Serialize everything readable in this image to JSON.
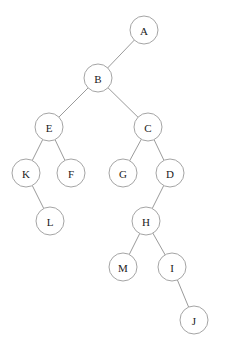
{
  "diagram": {
    "kind": "tree-diagram",
    "canvas": {
      "width": 225,
      "height": 356,
      "background": "#ffffff"
    },
    "style": {
      "node_radius": 14,
      "node_fill": "#ffffff",
      "node_stroke": "#9a9a9a",
      "edge_stroke": "#8f8f8f",
      "label_color": "#1b1b1b",
      "stroke_width": 0.9,
      "label_font_size": 11
    },
    "root": "A"
  },
  "chart_data": {
    "type": "diagram",
    "title": "",
    "nodes": [
      {
        "id": "A",
        "label": "A",
        "x": 144,
        "y": 30,
        "r": 14,
        "depth": 0
      },
      {
        "id": "B",
        "label": "B",
        "x": 98,
        "y": 78,
        "r": 14,
        "depth": 1
      },
      {
        "id": "E",
        "label": "E",
        "x": 49,
        "y": 127,
        "r": 14,
        "depth": 2
      },
      {
        "id": "C",
        "label": "C",
        "x": 148,
        "y": 127,
        "r": 14,
        "depth": 2
      },
      {
        "id": "K",
        "label": "K",
        "x": 26,
        "y": 173,
        "r": 14,
        "depth": 3
      },
      {
        "id": "F",
        "label": "F",
        "x": 71,
        "y": 173,
        "r": 14,
        "depth": 3
      },
      {
        "id": "G",
        "label": "G",
        "x": 123,
        "y": 173,
        "r": 14,
        "depth": 3
      },
      {
        "id": "D",
        "label": "D",
        "x": 170,
        "y": 173,
        "r": 14,
        "depth": 3
      },
      {
        "id": "L",
        "label": "L",
        "x": 50,
        "y": 221,
        "r": 14,
        "depth": 4
      },
      {
        "id": "H",
        "label": "H",
        "x": 146,
        "y": 221,
        "r": 14,
        "depth": 4
      },
      {
        "id": "M",
        "label": "M",
        "x": 123,
        "y": 267,
        "r": 14,
        "depth": 5
      },
      {
        "id": "I",
        "label": "I",
        "x": 172,
        "y": 267,
        "r": 14,
        "depth": 5
      },
      {
        "id": "J",
        "label": "J",
        "x": 194,
        "y": 320,
        "r": 14,
        "depth": 6
      }
    ],
    "edges": [
      {
        "from": "A",
        "to": "B",
        "side": "left"
      },
      {
        "from": "B",
        "to": "E",
        "side": "left"
      },
      {
        "from": "B",
        "to": "C",
        "side": "right"
      },
      {
        "from": "E",
        "to": "K",
        "side": "left"
      },
      {
        "from": "E",
        "to": "F",
        "side": "right"
      },
      {
        "from": "K",
        "to": "L",
        "side": "right"
      },
      {
        "from": "C",
        "to": "G",
        "side": "left"
      },
      {
        "from": "C",
        "to": "D",
        "side": "right"
      },
      {
        "from": "D",
        "to": "H",
        "side": "left"
      },
      {
        "from": "H",
        "to": "M",
        "side": "left"
      },
      {
        "from": "H",
        "to": "I",
        "side": "right"
      },
      {
        "from": "I",
        "to": "J",
        "side": "right"
      }
    ]
  }
}
